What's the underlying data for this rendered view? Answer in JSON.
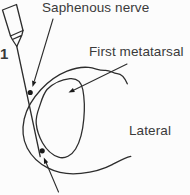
{
  "figure": {
    "type": "anatomical-line-diagram",
    "labels": {
      "step_number": "1",
      "saphenous_nerve": "Saphenous nerve",
      "first_metatarsal": "First metatarsal",
      "lateral": "Lateral"
    },
    "markers": {
      "injection_site_count": 2,
      "leader_arrow_count": 3
    },
    "icons": [
      "syringe-icon",
      "needle-line",
      "arrowhead-icon",
      "injection-site-dot"
    ],
    "colors": {
      "background": "#fcfcfc",
      "line": "#2d2d2d",
      "text": "#3a3a3a",
      "marker_fill": "#1b1b1b"
    }
  }
}
